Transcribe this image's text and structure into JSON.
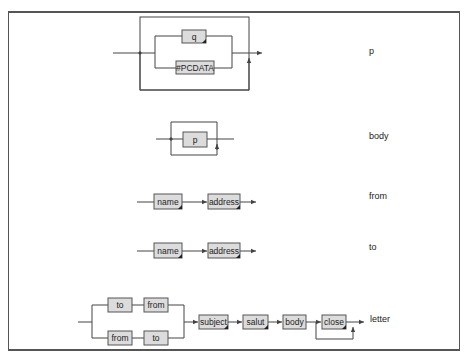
{
  "colors": {
    "line": "#444444",
    "node_fill": "#dcdcdc",
    "node_border": "#555555",
    "frame": "#555555"
  },
  "rules": [
    {
      "name": "p",
      "nodes": [
        "q",
        "#PCDATA"
      ],
      "structure": "choice, repeatable (zero or more)"
    },
    {
      "name": "body",
      "nodes": [
        "p"
      ],
      "structure": "one or more"
    },
    {
      "name": "from",
      "nodes": [
        "name",
        "address"
      ],
      "structure": "sequence"
    },
    {
      "name": "to",
      "nodes": [
        "name",
        "address"
      ],
      "structure": "sequence"
    },
    {
      "name": "letter",
      "nodes": [
        "to",
        "from",
        "from",
        "to",
        "subject",
        "salut",
        "body",
        "close"
      ],
      "structure": "choice of (to, from) or (from, to), then subject, salut, body, close (one or more)"
    }
  ],
  "labels": {
    "p": "p",
    "body": "body",
    "from": "from",
    "to": "to",
    "letter": "letter"
  },
  "nodes": {
    "p_q": "q",
    "p_pcdata": "#PCDATA",
    "body_p": "p",
    "from_name": "name",
    "from_address": "address",
    "to_name": "name",
    "to_address": "address",
    "letter_to_1": "to",
    "letter_from_1": "from",
    "letter_from_2": "from",
    "letter_to_2": "to",
    "letter_subject": "subject",
    "letter_salut": "salut",
    "letter_body": "body",
    "letter_close": "close"
  }
}
